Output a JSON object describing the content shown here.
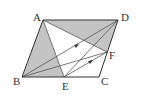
{
  "figure": {
    "type": "parallelogram-diagram",
    "points": {
      "A": {
        "label": "A"
      },
      "B": {
        "label": "B"
      },
      "C": {
        "label": "C"
      },
      "D": {
        "label": "D"
      },
      "E": {
        "label": "E"
      },
      "F": {
        "label": "F"
      }
    },
    "shaded_regions": [
      "ABE",
      "ADF"
    ],
    "segments": [
      "AB",
      "BC",
      "CD",
      "DA",
      "AE",
      "AF",
      "BD",
      "BF",
      "ED",
      "EF"
    ],
    "parallel_marks": [
      "BD",
      "EF"
    ],
    "colors": {
      "shade": "#c4c4c4",
      "line": "#333333"
    }
  }
}
